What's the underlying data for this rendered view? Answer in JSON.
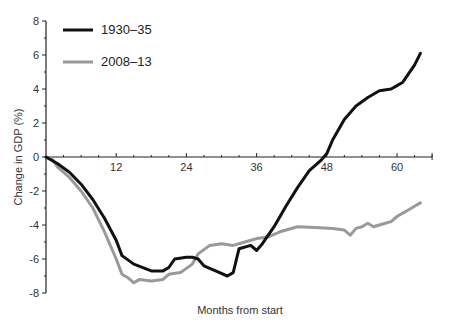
{
  "chart_data": {
    "type": "line",
    "title": "",
    "xlabel": "Months from start",
    "ylabel": "Change in GDP (%)",
    "xlim": [
      0,
      66
    ],
    "ylim": [
      -8,
      8
    ],
    "xticks": [
      12,
      24,
      36,
      48,
      60
    ],
    "yticks": [
      -8,
      -6,
      -4,
      -2,
      0,
      2,
      4,
      6,
      8
    ],
    "grid": false,
    "legend_position": "upper-left",
    "series": [
      {
        "name": "1930–35",
        "color": "#111111",
        "x": [
          0,
          2,
          4,
          6,
          8,
          10,
          12,
          13,
          15,
          18,
          20,
          21,
          22,
          24,
          25,
          26,
          27,
          29,
          31,
          32,
          33,
          35,
          36,
          37,
          39,
          41,
          43,
          45,
          47,
          48,
          49,
          51,
          53,
          55,
          57,
          59,
          60,
          61,
          63,
          64
        ],
        "values": [
          0,
          -0.4,
          -0.9,
          -1.6,
          -2.5,
          -3.6,
          -4.9,
          -5.8,
          -6.3,
          -6.7,
          -6.7,
          -6.5,
          -6.0,
          -5.9,
          -5.9,
          -6.0,
          -6.4,
          -6.7,
          -7.0,
          -6.8,
          -5.4,
          -5.2,
          -5.5,
          -5.1,
          -4.1,
          -2.9,
          -1.8,
          -0.8,
          -0.2,
          0.2,
          1.0,
          2.2,
          3.0,
          3.5,
          3.9,
          4.0,
          4.2,
          4.4,
          5.4,
          6.1
        ]
      },
      {
        "name": "2008–13",
        "color": "#999999",
        "x": [
          0,
          1,
          2,
          4,
          6,
          8,
          10,
          12,
          13,
          14,
          15,
          16,
          18,
          20,
          21,
          23,
          25,
          26,
          28,
          30,
          32,
          34,
          35,
          36,
          38,
          40,
          43,
          46,
          49,
          51,
          52,
          53,
          54,
          55,
          56,
          57,
          58,
          59,
          60,
          61,
          62,
          63,
          64
        ],
        "values": [
          0,
          -0.1,
          -0.6,
          -1.2,
          -2.0,
          -3.0,
          -4.4,
          -6.0,
          -6.9,
          -7.1,
          -7.4,
          -7.2,
          -7.3,
          -7.2,
          -6.9,
          -6.8,
          -6.3,
          -5.7,
          -5.2,
          -5.1,
          -5.2,
          -5.0,
          -4.9,
          -4.8,
          -4.7,
          -4.4,
          -4.1,
          -4.15,
          -4.2,
          -4.3,
          -4.6,
          -4.2,
          -4.1,
          -3.9,
          -4.1,
          -4.0,
          -3.9,
          -3.8,
          -3.5,
          -3.3,
          -3.1,
          -2.9,
          -2.7
        ]
      }
    ]
  },
  "legend": {
    "items": [
      {
        "label": "1930–35",
        "color": "#111111"
      },
      {
        "label": "2008–13",
        "color": "#999999"
      }
    ]
  },
  "axes": {
    "xlabel": "Months from start",
    "ylabel": "Change in GDP (%)",
    "xtick_labels": [
      "12",
      "24",
      "36",
      "48",
      "60"
    ],
    "ytick_labels": [
      "8",
      "6",
      "4",
      "2",
      "0",
      "-2",
      "-4",
      "-6",
      "-8"
    ]
  }
}
